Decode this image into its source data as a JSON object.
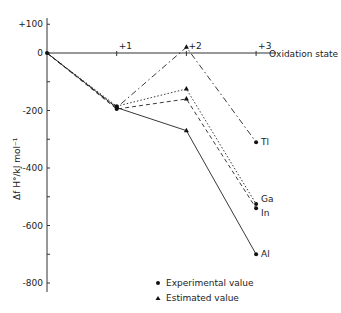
{
  "chart_data": {
    "type": "line",
    "title": "",
    "xlabel": "Oxidation state",
    "ylabel": "Δf H°/kJ mol⁻¹",
    "x": [
      0,
      1,
      2,
      3
    ],
    "x_tick_labels": [
      "+1",
      "+2",
      "+3"
    ],
    "y_tick_labels": [
      "+100",
      "0",
      "-200",
      "-400",
      "-600",
      "-800"
    ],
    "ylim": [
      -850,
      150
    ],
    "grid": false,
    "series": [
      {
        "name": "Al",
        "style": "solid",
        "values": [
          0,
          -190,
          -270,
          -700
        ]
      },
      {
        "name": "Ga",
        "style": "dotted",
        "values": [
          0,
          -185,
          -125,
          -525
        ]
      },
      {
        "name": "In",
        "style": "dashed",
        "values": [
          0,
          -195,
          -160,
          -540
        ]
      },
      {
        "name": "Tl",
        "style": "dash-dot",
        "values": [
          0,
          -190,
          20,
          -310
        ]
      }
    ],
    "legend": [
      {
        "marker": "circle",
        "label": "Experimental value"
      },
      {
        "marker": "triangle",
        "label": "Estimated value"
      }
    ]
  }
}
